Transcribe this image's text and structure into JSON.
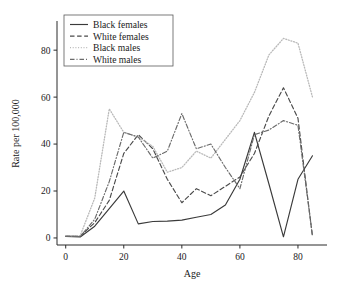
{
  "chart_data": {
    "type": "line",
    "title": "",
    "xlabel": "Age",
    "ylabel": "Rate per 100,000",
    "xlim": [
      -3,
      90
    ],
    "ylim": [
      -3,
      92
    ],
    "xticks": [
      0,
      20,
      40,
      60,
      80
    ],
    "yticks": [
      0,
      20,
      40,
      60,
      80
    ],
    "xtick_labels": [
      "0",
      "20",
      "40",
      "60",
      "80"
    ],
    "ytick_labels": [
      "0",
      "20",
      "40",
      "60",
      "80"
    ],
    "grid": false,
    "legend_position": "top-left",
    "x": [
      0,
      5,
      10,
      15,
      20,
      25,
      30,
      35,
      40,
      45,
      50,
      55,
      60,
      65,
      70,
      75,
      80,
      85
    ],
    "series": [
      {
        "name": "Black females",
        "style": "solid",
        "color": "#3a3a3a",
        "values": [
          0.6,
          0.4,
          5.0,
          12.5,
          20.0,
          6.0,
          7.0,
          7.2,
          7.6,
          8.8,
          10.0,
          14.0,
          25.0,
          45.0,
          23.0,
          0.5,
          25.0,
          35.0
        ]
      },
      {
        "name": "White females",
        "style": "dashed",
        "color": "#4a4a4a",
        "values": [
          0.8,
          0.8,
          6.5,
          16.0,
          36.0,
          44.0,
          38.0,
          25.0,
          15.0,
          21.0,
          18.0,
          22.0,
          26.0,
          36.0,
          52.0,
          64.0,
          51.0,
          0.5
        ]
      },
      {
        "name": "Black males",
        "style": "dotted",
        "color": "#b9b9b9",
        "values": [
          0.9,
          1.0,
          17.0,
          55.0,
          45.0,
          43.0,
          39.0,
          28.0,
          30.0,
          37.0,
          34.0,
          42.0,
          50.0,
          62.0,
          78.0,
          85.0,
          83.0,
          60.0
        ]
      },
      {
        "name": "White males",
        "style": "dashdot",
        "color": "#6b6b6b",
        "values": [
          0.7,
          0.6,
          8.0,
          24.0,
          45.0,
          43.0,
          34.0,
          37.0,
          53.0,
          38.0,
          40.0,
          30.0,
          21.0,
          44.0,
          46.0,
          50.0,
          48.0,
          1.0
        ]
      }
    ]
  },
  "legend": {
    "entries": [
      {
        "label": "Black females"
      },
      {
        "label": "White females"
      },
      {
        "label": "Black males"
      },
      {
        "label": "White males"
      }
    ]
  }
}
